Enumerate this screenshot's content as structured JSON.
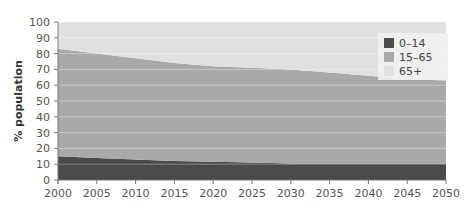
{
  "chart_data": {
    "type": "area",
    "stacked": true,
    "title": "",
    "xlabel": "",
    "ylabel": "% population",
    "x": [
      2000,
      2005,
      2010,
      2015,
      2020,
      2025,
      2030,
      2035,
      2040,
      2045,
      2050
    ],
    "x_ticks": [
      "2000",
      "2005",
      "2010",
      "2015",
      "2020",
      "2025",
      "2030",
      "2035",
      "2040",
      "2045",
      "2050"
    ],
    "y_ticks": [
      "0",
      "10",
      "20",
      "30",
      "40",
      "50",
      "60",
      "70",
      "80",
      "90",
      "100"
    ],
    "ylim": [
      0,
      100
    ],
    "xlim": [
      2000,
      2050
    ],
    "grid": true,
    "legend_position": "upper right",
    "series": [
      {
        "name": "0–14",
        "color": "#4a4a4a",
        "values": [
          15,
          14,
          13,
          12,
          11.5,
          11,
          10.5,
          10.5,
          10.5,
          10.5,
          10.5
        ]
      },
      {
        "name": "15–65",
        "color": "#a9a9a9",
        "values": [
          68,
          66,
          64,
          62,
          60.5,
          60,
          59.5,
          57.5,
          55.5,
          53.5,
          52.5
        ]
      },
      {
        "name": "65+",
        "color": "#e0e0e0",
        "values": [
          17,
          20,
          23,
          26,
          28,
          29,
          30,
          32,
          34,
          36,
          37
        ]
      }
    ]
  }
}
